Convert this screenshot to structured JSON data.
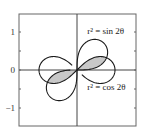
{
  "chart_data": {
    "type": "line",
    "subtype": "polar-curves",
    "title": "",
    "xlabel": "",
    "ylabel": "",
    "xlim": [
      -1.5,
      1.5
    ],
    "ylim": [
      -1.5,
      1.5
    ],
    "grid": false,
    "axes_through_origin": true,
    "yticks": [
      {
        "value": 1,
        "label": "1"
      },
      {
        "value": 0,
        "label": "0"
      },
      {
        "value": -1,
        "label": "−1"
      }
    ],
    "minor_yticks": [
      1.5,
      0.5,
      -0.5,
      -1.5
    ],
    "series": [
      {
        "name": "r² = sin 2θ",
        "equation": "r^2 = sin(2*theta)",
        "label": "r² = sin 2θ",
        "label_pos": [
          0.27,
          0.95
        ],
        "color": "#1a1a1a"
      },
      {
        "name": "r² = cos 2θ",
        "equation": "r^2 = cos(2*theta)",
        "label": "r² = cos 2θ",
        "label_pos": [
          0.27,
          -0.53
        ],
        "color": "#1a1a1a"
      }
    ],
    "shaded_region": {
      "description": "Region inside both lemniscates (first and third quadrants)",
      "fill": "#c8c8c8"
    },
    "colors": {
      "axis": "#444444",
      "frame": "#666666",
      "curve": "#1a1a1a",
      "shade": "#c8c8c8"
    }
  }
}
